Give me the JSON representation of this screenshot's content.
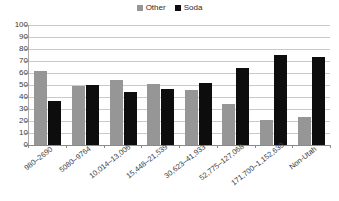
{
  "chart_data": {
    "type": "bar",
    "title": "",
    "subtitle": "",
    "xlabel": "",
    "ylabel": "",
    "ylim": [
      0,
      100
    ],
    "ytick_step": 10,
    "yticks": [
      100,
      90,
      80,
      70,
      60,
      50,
      40,
      30,
      20,
      10,
      0
    ],
    "grid": true,
    "legend_position": "top-center",
    "categories": [
      "980–2690",
      "5080–9764",
      "10,014–13,006",
      "15,448–21,539",
      "30,623–41,933",
      "52,775–127,068",
      "171,700–1,152,630",
      "Non-Utah"
    ],
    "series": [
      {
        "name": "Other",
        "color": "#969696",
        "values": [
          62,
          49,
          54,
          51,
          46,
          34,
          21,
          23
        ]
      },
      {
        "name": "Soda",
        "color": "#0d0d0d",
        "values": [
          37,
          50,
          44,
          47,
          52,
          64,
          75,
          73
        ]
      }
    ]
  },
  "legend": {
    "entries": [
      {
        "label": "Other",
        "color": "#969696"
      },
      {
        "label": "Soda",
        "color": "#0d0d0d"
      }
    ]
  }
}
